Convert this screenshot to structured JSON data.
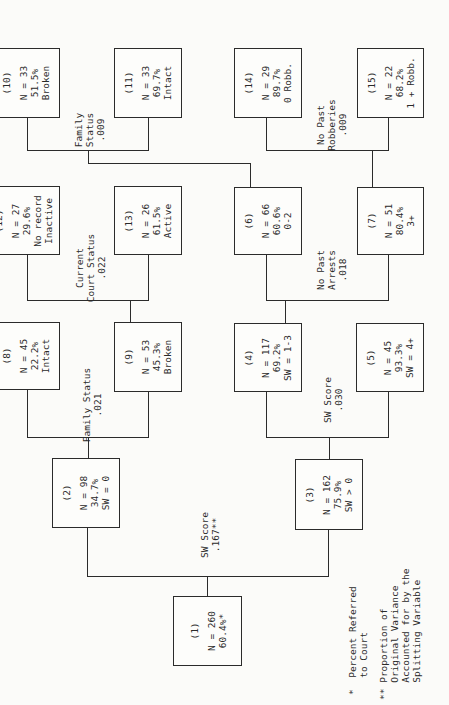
{
  "nodes": {
    "n1": {
      "id": "(1)",
      "lines": [
        "N = 260",
        "60.4%*"
      ]
    },
    "n2": {
      "id": "(2)",
      "lines": [
        "N = 98",
        "34.7%",
        "SW = 0"
      ]
    },
    "n3": {
      "id": "(3)",
      "lines": [
        "N = 162",
        "75.9%",
        "SW > 0"
      ]
    },
    "n4": {
      "id": "(4)",
      "lines": [
        "N = 117",
        "69.2%",
        "SW = 1-3"
      ]
    },
    "n5": {
      "id": "(5)",
      "lines": [
        "N = 45",
        "93.3%",
        "SW = 4+"
      ]
    },
    "n6": {
      "id": "(6)",
      "lines": [
        "N = 66",
        "60.6%",
        "0-2"
      ]
    },
    "n7": {
      "id": "(7)",
      "lines": [
        "N = 51",
        "80.4%",
        "3+"
      ]
    },
    "n8": {
      "id": "(8)",
      "lines": [
        "N = 45",
        "22.2%",
        "Intact"
      ]
    },
    "n9": {
      "id": "(9)",
      "lines": [
        "N = 53",
        "45.3%",
        "Broken"
      ]
    },
    "n10": {
      "id": "(10)",
      "lines": [
        "N = 33",
        "51.5%",
        "Broken"
      ]
    },
    "n11": {
      "id": "(11)",
      "lines": [
        "N = 33",
        "69.7%",
        "Intact"
      ]
    },
    "n12": {
      "id": "(12)",
      "lines": [
        "N = 27",
        "29.6%",
        "No record",
        "Inactive"
      ]
    },
    "n13": {
      "id": "(13)",
      "lines": [
        "N = 26",
        "61.5%",
        "Active"
      ]
    },
    "n14": {
      "id": "(14)",
      "lines": [
        "N = 29",
        "89.7%",
        "0 Robb."
      ]
    },
    "n15": {
      "id": "(15)",
      "lines": [
        "N = 22",
        "68.2%",
        "1 + Robb."
      ]
    }
  },
  "splits": {
    "s1": [
      "SW Score",
      ".167**"
    ],
    "s2": [
      "Family Status",
      ".021"
    ],
    "s3": [
      "SW Score",
      ".030"
    ],
    "s9": [
      "Current",
      "Court Status",
      ".022"
    ],
    "s4": [
      "No Past",
      "Arrests",
      ".018"
    ],
    "s6": [
      "Family",
      "Status",
      ".009"
    ],
    "s7": [
      "No Past",
      "Robberies",
      ".009"
    ]
  },
  "legend": {
    "single_star": [
      "*  Percent Referred",
      "   to Court"
    ],
    "double_star": [
      "** Proportion of",
      "   Original Variance",
      "   Accounted for by the",
      "   Splitting Variable"
    ]
  }
}
